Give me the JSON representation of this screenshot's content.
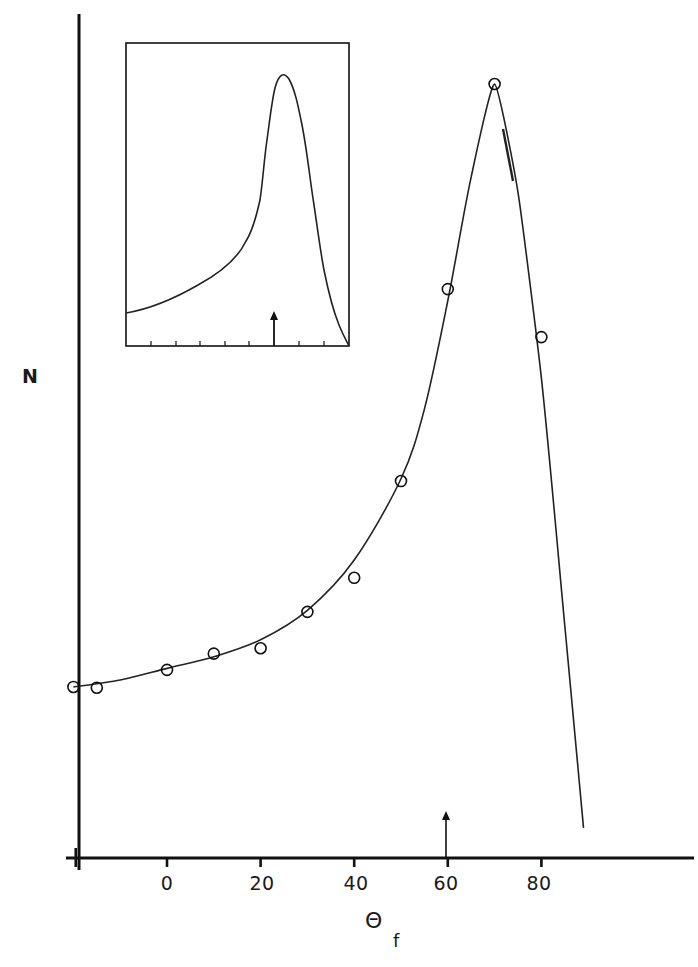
{
  "chart_data": {
    "type": "scatter",
    "title": "",
    "xlabel": "Θ",
    "xlabel_subscript": "f",
    "ylabel": "N",
    "x_ticks": [
      0,
      20,
      40,
      60,
      80
    ],
    "x_tick_labels": [
      "0",
      "20",
      "40",
      "60",
      "80"
    ],
    "xlim": [
      -20,
      115
    ],
    "ylim": [
      0,
      100
    ],
    "y_units": "arbitrary (normalized, peak = 100)",
    "grid": false,
    "legend": null,
    "series": [
      {
        "name": "measured",
        "marker": "open-circle",
        "x": [
          -20,
          -15,
          0,
          10,
          20,
          30,
          40,
          50,
          60,
          70,
          80
        ],
        "y": [
          22.1,
          22.0,
          24.3,
          26.4,
          27.1,
          31.8,
          36.2,
          48.7,
          73.5,
          100,
          67.3
        ]
      },
      {
        "name": "fitted curve",
        "style": "line",
        "x": [
          -20,
          -10,
          0,
          10,
          20,
          30,
          40,
          50,
          55,
          60,
          65,
          70,
          75,
          80,
          85,
          89
        ],
        "y": [
          22.1,
          23.0,
          24.5,
          26.0,
          28.2,
          32.0,
          38.5,
          49.0,
          58.0,
          72.0,
          88.0,
          100,
          86.0,
          62.0,
          30.0,
          3.9
        ]
      }
    ],
    "annotations": [
      {
        "type": "arrow",
        "x": 60,
        "direction": "up",
        "description": "marker arrow at Θf = 60 on x-axis"
      }
    ],
    "inset": {
      "type": "line",
      "description": "inset plot showing a smooth asymmetric peak; unlabeled axes with minor ticks and an up-arrow marker under the peak",
      "x_ticks_count": 9,
      "peak_position_fraction": 0.65,
      "arrow_position_fraction": 0.665
    }
  },
  "labels": {
    "ylabel": "N",
    "xlabel": "Θ",
    "xlabel_sub": "f",
    "ticks": [
      "0",
      "20",
      "40",
      "60",
      "80"
    ]
  }
}
